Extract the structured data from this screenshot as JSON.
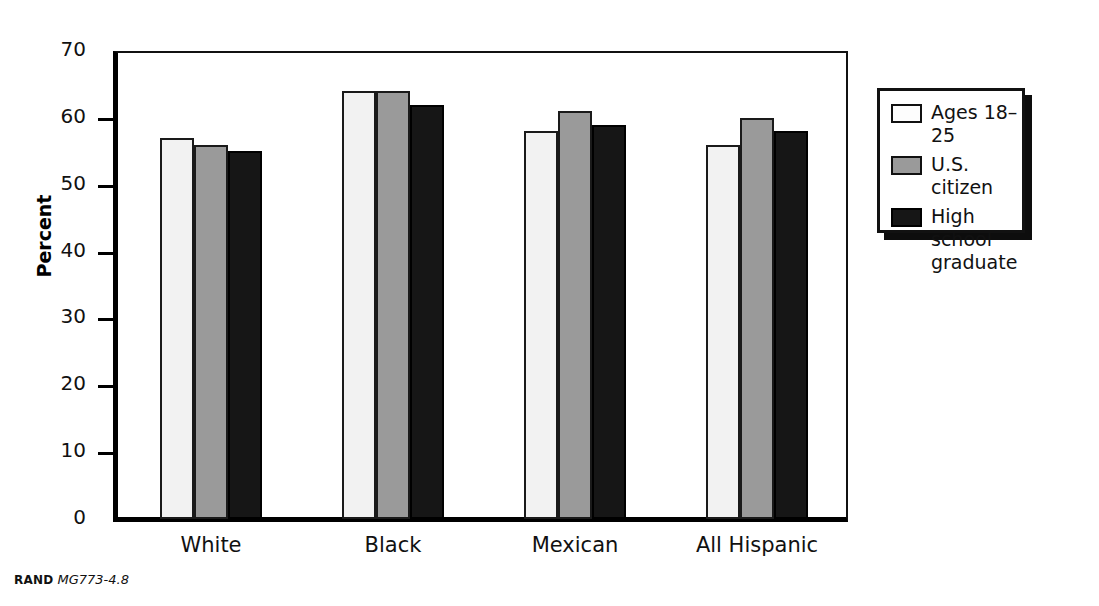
{
  "chart_data": {
    "type": "bar",
    "title": "",
    "subtitle": "",
    "xlabel": "",
    "ylabel": "Percent",
    "ylim": [
      0,
      70
    ],
    "yticks": [
      0,
      10,
      20,
      30,
      40,
      50,
      60,
      70
    ],
    "ytick_labels": [
      "0",
      "10",
      "20",
      "30",
      "40",
      "50",
      "60",
      "70"
    ],
    "grid": false,
    "legend_position": "right",
    "categories": [
      "White",
      "Black",
      "Mexican",
      "All Hispanic"
    ],
    "series": [
      {
        "name": "Ages 18–25",
        "values": [
          57,
          64,
          58,
          56
        ],
        "color": "#f2f2f2"
      },
      {
        "name": "U.S. citizen",
        "values": [
          56,
          64,
          61,
          60
        ],
        "color": "#9a9a9a"
      },
      {
        "name": "High school\ngraduate",
        "values": [
          55,
          62,
          59,
          58
        ],
        "color": "#161616"
      }
    ]
  },
  "axis": {
    "y_title": "Percent",
    "y_tick_labels": [
      "70",
      "60",
      "50",
      "40",
      "30",
      "20",
      "10",
      "0"
    ],
    "x_tick_labels": [
      "White",
      "Black",
      "Mexican",
      "All Hispanic"
    ]
  },
  "legend": {
    "items": [
      {
        "label": "Ages 18–25",
        "swatch": "white-swatch"
      },
      {
        "label": "U.S. citizen",
        "swatch": "gray-swatch"
      },
      {
        "label": "High school\ngraduate",
        "swatch": "black-swatch"
      }
    ]
  },
  "footer": {
    "publisher": "RAND",
    "document_id": "MG773-4.8"
  },
  "colors": {
    "series_white": "#f2f2f2",
    "series_gray": "#9a9a9a",
    "series_black": "#161616",
    "axis": "#000000",
    "background": "#ffffff"
  }
}
